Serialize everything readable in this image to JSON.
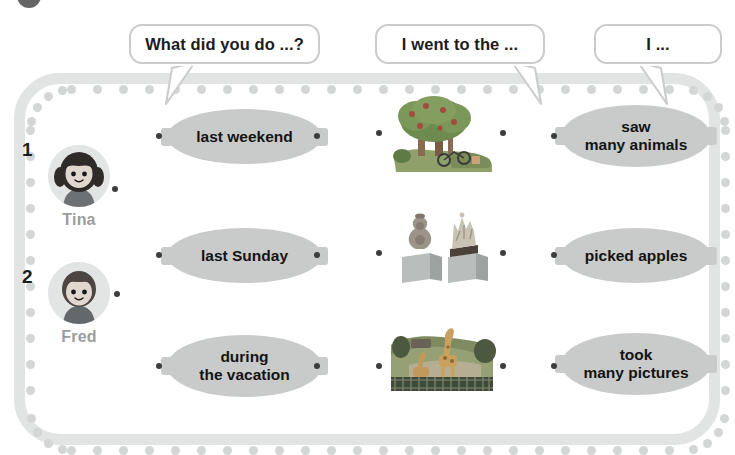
{
  "exercise": {
    "badge_label": "",
    "prompts": [
      {
        "id": "prompt-question",
        "text": "What did you do ...?"
      },
      {
        "id": "prompt-place",
        "text": "I went to the ..."
      },
      {
        "id": "prompt-action",
        "text": "I ..."
      }
    ],
    "people": [
      {
        "number": "1",
        "name": "Tina",
        "icon": "girl-avatar-icon"
      },
      {
        "number": "2",
        "name": "Fred",
        "icon": "boy-avatar-icon"
      }
    ],
    "time_phrases": [
      {
        "id": "time-1",
        "text": "last weekend"
      },
      {
        "id": "time-2",
        "text": "last Sunday"
      },
      {
        "id": "time-3",
        "line1": "during",
        "line2": "the vacation"
      }
    ],
    "pictures": [
      {
        "id": "picture-orchard",
        "icon": "apple-orchard-icon",
        "alt": "apple tree orchard"
      },
      {
        "id": "picture-museum",
        "icon": "museum-exhibit-icon",
        "alt": "vase and crown on pedestals"
      },
      {
        "id": "picture-zoo",
        "icon": "zoo-giraffe-icon",
        "alt": "giraffes at the zoo"
      }
    ],
    "actions": [
      {
        "id": "action-1",
        "line1": "saw",
        "line2": "many animals"
      },
      {
        "id": "action-2",
        "line1": "picked apples",
        "line2": ""
      },
      {
        "id": "action-3",
        "line1": "took",
        "line2": "many pictures"
      }
    ],
    "colors": {
      "oval_fill": "#c9cbca",
      "frame": "#e2e4e3",
      "bead": "#d3d6d5",
      "dot": "#3d3d3d",
      "name_text": "#9a9d9c",
      "body_text": "#141414",
      "bubble_border": "#c9cccb"
    }
  }
}
